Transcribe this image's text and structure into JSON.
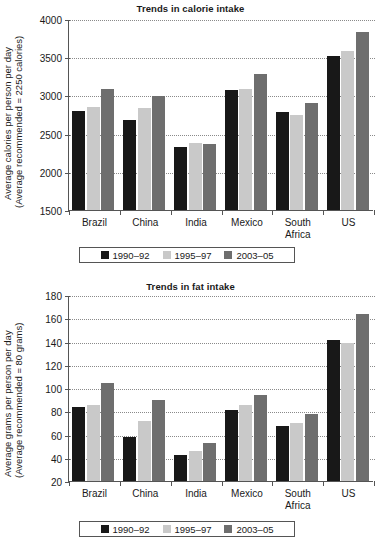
{
  "chart_data": [
    {
      "id": "calorie",
      "type": "bar",
      "title": "Trends in calorie intake",
      "xlabel": "",
      "ylabel_line1": "Average calories per person per day",
      "ylabel_line2": "(Average recommended = 2250 calories)",
      "ylim": [
        1500,
        4000
      ],
      "ytick_step": 500,
      "yticks": [
        "4000",
        "3500",
        "3000",
        "2500",
        "2000",
        "1500"
      ],
      "grid": true,
      "legend_position": "below-axis",
      "categories": [
        "Brazil",
        "China",
        "India",
        "Mexico",
        "South Africa",
        "US"
      ],
      "series": [
        {
          "name": "1990–92",
          "color": "#181818",
          "values": [
            2800,
            2680,
            2320,
            3070,
            2780,
            3510
          ]
        },
        {
          "name": "1995–97",
          "color": "#c9c9c9",
          "values": [
            2850,
            2840,
            2380,
            3080,
            2750,
            3580
          ]
        },
        {
          "name": "2003–05",
          "color": "#6e6e6e",
          "values": [
            3080,
            2990,
            2370,
            3280,
            2900,
            3830
          ]
        }
      ]
    },
    {
      "id": "fat",
      "type": "bar",
      "title": "Trends in fat intake",
      "xlabel": "",
      "ylabel_line1": "Average grams per person per day",
      "ylabel_line2": "(Average recommended = 80 grams)",
      "ylim": [
        20,
        180
      ],
      "ytick_step": 20,
      "yticks": [
        "180",
        "160",
        "140",
        "120",
        "100",
        "80",
        "60",
        "40",
        "20"
      ],
      "grid": true,
      "legend_position": "below-axis",
      "categories": [
        "Brazil",
        "China",
        "India",
        "Mexico",
        "South Africa",
        "US"
      ],
      "series": [
        {
          "name": "1990–92",
          "color": "#181818",
          "values": [
            84,
            58,
            42,
            81,
            67,
            141
          ]
        },
        {
          "name": "1995–97",
          "color": "#c9c9c9",
          "values": [
            85,
            72,
            46,
            85,
            70,
            139
          ]
        },
        {
          "name": "2003–05",
          "color": "#6e6e6e",
          "values": [
            104,
            90,
            53,
            94,
            78,
            164
          ]
        }
      ]
    }
  ]
}
